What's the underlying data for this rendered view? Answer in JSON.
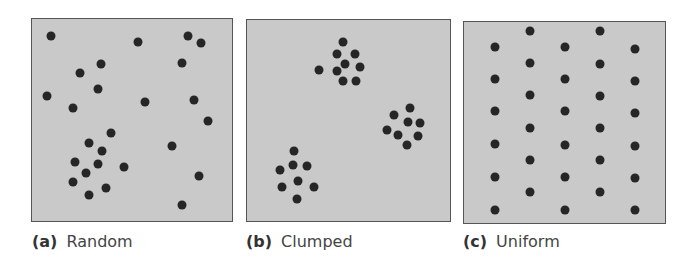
{
  "colors": {
    "panel_fill": "#c9c9c9",
    "panel_border": "#555555",
    "dot": "#262626"
  },
  "panels": [
    {
      "id": "a",
      "letter": "(a)",
      "label": "Random",
      "box": {
        "x": 31,
        "y": 18,
        "w": 202,
        "h": 204
      },
      "caption_x": 32,
      "dots": [
        [
          51,
          36
        ],
        [
          138,
          42
        ],
        [
          188,
          36
        ],
        [
          201,
          43
        ],
        [
          182,
          63
        ],
        [
          101,
          64
        ],
        [
          80,
          73
        ],
        [
          98,
          89
        ],
        [
          47,
          96
        ],
        [
          145,
          102
        ],
        [
          194,
          100
        ],
        [
          73,
          108
        ],
        [
          208,
          121
        ],
        [
          111,
          133
        ],
        [
          89,
          143
        ],
        [
          172,
          146
        ],
        [
          102,
          151
        ],
        [
          75,
          162
        ],
        [
          98,
          164
        ],
        [
          124,
          167
        ],
        [
          86,
          173
        ],
        [
          199,
          176
        ],
        [
          73,
          182
        ],
        [
          106,
          188
        ],
        [
          89,
          195
        ],
        [
          182,
          205
        ]
      ]
    },
    {
      "id": "b",
      "letter": "(b)",
      "label": "Clumped",
      "box": {
        "x": 246,
        "y": 19,
        "w": 205,
        "h": 203
      },
      "caption_x": 246,
      "dots": [
        [
          343,
          42
        ],
        [
          337,
          54
        ],
        [
          355,
          54
        ],
        [
          345,
          64
        ],
        [
          360,
          67
        ],
        [
          337,
          71
        ],
        [
          319,
          70
        ],
        [
          343,
          81
        ],
        [
          356,
          81
        ],
        [
          410,
          108
        ],
        [
          394,
          115
        ],
        [
          408,
          122
        ],
        [
          420,
          123
        ],
        [
          387,
          130
        ],
        [
          398,
          135
        ],
        [
          418,
          136
        ],
        [
          407,
          145
        ],
        [
          294,
          151
        ],
        [
          293,
          165
        ],
        [
          307,
          166
        ],
        [
          280,
          170
        ],
        [
          298,
          181
        ],
        [
          282,
          187
        ],
        [
          314,
          187
        ],
        [
          297,
          199
        ]
      ]
    },
    {
      "id": "c",
      "letter": "(c)",
      "label": "Uniform",
      "box": {
        "x": 463,
        "y": 21,
        "w": 203,
        "h": 203
      },
      "caption_x": 463,
      "dots": [
        [
          530,
          31
        ],
        [
          600,
          31
        ],
        [
          495,
          47
        ],
        [
          565,
          47
        ],
        [
          635,
          49
        ],
        [
          530,
          63
        ],
        [
          600,
          64
        ],
        [
          495,
          79
        ],
        [
          565,
          79
        ],
        [
          635,
          81
        ],
        [
          530,
          95
        ],
        [
          600,
          96
        ],
        [
          495,
          111
        ],
        [
          565,
          111
        ],
        [
          635,
          113
        ],
        [
          530,
          128
        ],
        [
          600,
          128
        ],
        [
          495,
          144
        ],
        [
          565,
          145
        ],
        [
          635,
          146
        ],
        [
          530,
          160
        ],
        [
          600,
          160
        ],
        [
          495,
          177
        ],
        [
          565,
          177
        ],
        [
          635,
          178
        ],
        [
          530,
          192
        ],
        [
          600,
          192
        ],
        [
          495,
          210
        ],
        [
          565,
          210
        ],
        [
          635,
          210
        ]
      ]
    }
  ]
}
